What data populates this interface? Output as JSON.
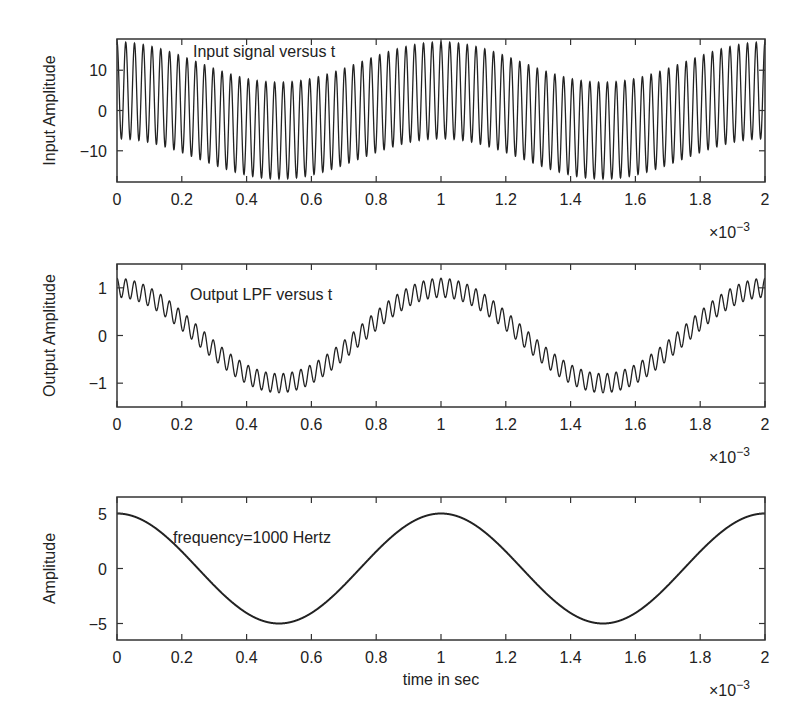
{
  "figure": {
    "background": "#ffffff",
    "line_color": "#222222",
    "axis_color": "#333333"
  },
  "chart_data": [
    {
      "type": "line",
      "id": "input",
      "title": "",
      "annotation": "Input signal versus t",
      "xlabel": "",
      "ylabel": "Input Amplitude",
      "x_multiplier": "×10",
      "x_multiplier_exp": "−3",
      "xlim": [
        0,
        2
      ],
      "ylim": [
        -17.75,
        17.75
      ],
      "xticks": [
        0,
        0.2,
        0.4,
        0.6,
        0.8,
        1,
        1.2,
        1.4,
        1.6,
        1.8,
        2
      ],
      "xtick_labels": [
        "0",
        "0.2",
        "0.4",
        "0.6",
        "0.8",
        "1",
        "1.2",
        "1.4",
        "1.6",
        "1.8",
        "2"
      ],
      "yticks": [
        10,
        0,
        -10
      ],
      "ytick_labels": [
        "10",
        "0",
        "−10"
      ],
      "grid": false,
      "signal": {
        "description": "1 kHz cosine (amp 5) plus high-frequency carrier (~37 kHz, amp ~12)",
        "components": [
          {
            "amplitude": 5,
            "cycles_per_unit": 1
          },
          {
            "amplitude": 12,
            "cycles_per_unit": 37
          }
        ]
      },
      "box": {
        "left": 117,
        "top": 39,
        "right": 765,
        "bottom": 182
      }
    },
    {
      "type": "line",
      "id": "output",
      "title": "",
      "annotation": "Output LPF versus t",
      "xlabel": "",
      "ylabel": "Output Amplitude",
      "x_multiplier": "×10",
      "x_multiplier_exp": "−3",
      "xlim": [
        0,
        2
      ],
      "ylim": [
        -1.5,
        1.5
      ],
      "xticks": [
        0,
        0.2,
        0.4,
        0.6,
        0.8,
        1,
        1.2,
        1.4,
        1.6,
        1.8,
        2
      ],
      "xtick_labels": [
        "0",
        "0.2",
        "0.4",
        "0.6",
        "0.8",
        "1",
        "1.2",
        "1.4",
        "1.6",
        "1.8",
        "2"
      ],
      "yticks": [
        1,
        0,
        -1
      ],
      "ytick_labels": [
        "1",
        "0",
        "−1"
      ],
      "grid": false,
      "signal": {
        "description": "Low-pass filtered output: 1 kHz cosine (amp ~1) with residual ripple (~0.2)",
        "components": [
          {
            "amplitude": 1.0,
            "cycles_per_unit": 1
          },
          {
            "amplitude": 0.2,
            "cycles_per_unit": 37
          }
        ]
      },
      "box": {
        "left": 117,
        "top": 264,
        "right": 765,
        "bottom": 407
      }
    },
    {
      "type": "line",
      "id": "reference",
      "title": "",
      "annotation": "frequency=1000 Hertz",
      "xlabel": "time in sec",
      "ylabel": "Amplitude",
      "x_multiplier": "×10",
      "x_multiplier_exp": "−3",
      "xlim": [
        0,
        2
      ],
      "ylim": [
        -6.5,
        6.5
      ],
      "xticks": [
        0,
        0.2,
        0.4,
        0.6,
        0.8,
        1,
        1.2,
        1.4,
        1.6,
        1.8,
        2
      ],
      "xtick_labels": [
        "0",
        "0.2",
        "0.4",
        "0.6",
        "0.8",
        "1",
        "1.2",
        "1.4",
        "1.6",
        "1.8",
        "2"
      ],
      "yticks": [
        5,
        0,
        -5
      ],
      "ytick_labels": [
        "5",
        "0",
        "−5"
      ],
      "grid": false,
      "signal": {
        "description": "Pure 1000 Hz cosine, amplitude 5",
        "components": [
          {
            "amplitude": 5,
            "cycles_per_unit": 1
          }
        ]
      },
      "box": {
        "left": 117,
        "top": 497,
        "right": 765,
        "bottom": 640
      }
    }
  ],
  "labels": {
    "plot1_annotation": "Input signal versus t",
    "plot2_annotation": "Output LPF versus t",
    "plot3_annotation": "frequency=1000 Hertz",
    "plot3_xlabel": "time in sec"
  }
}
